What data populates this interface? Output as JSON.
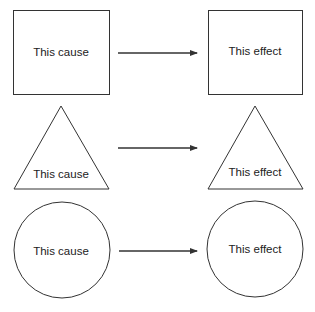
{
  "rows": [
    {
      "shape": "square",
      "cause": "This cause",
      "effect": "This effect"
    },
    {
      "shape": "triangle",
      "cause": "This cause",
      "effect": "This effect"
    },
    {
      "shape": "circle",
      "cause": "This cause",
      "effect": "This effect"
    }
  ],
  "colors": {
    "stroke": "#333333",
    "text": "#222222",
    "background": "#ffffff"
  }
}
